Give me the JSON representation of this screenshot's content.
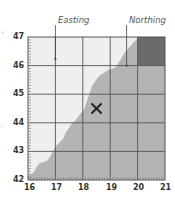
{
  "diagram": {
    "title": "",
    "labels": {
      "easting": "Easting",
      "northing": "Northing"
    },
    "x_axis": {
      "min": 16,
      "max": 21,
      "ticks": [
        "16",
        "17",
        "18",
        "19",
        "20",
        "21"
      ]
    },
    "y_axis": {
      "min": 42,
      "max": 47,
      "ticks": [
        "42",
        "43",
        "44",
        "45",
        "46",
        "47"
      ]
    },
    "marker": {
      "symbol": "×",
      "easting": 18.5,
      "northing": 44.5
    },
    "highlight_square": {
      "easting_range": [
        20,
        21
      ],
      "northing_range": [
        46,
        47
      ],
      "color": "#6a6a6a"
    },
    "easting_pointer": {
      "easting": 17.0,
      "northing": 46.3
    },
    "northing_pointer": {
      "easting": 19.55,
      "northing": 46.0
    },
    "colors": {
      "background_region": "#efefef",
      "shaded_region": "#b4b4b4",
      "grid": "#555555",
      "dark_square": "#6a6a6a"
    }
  }
}
